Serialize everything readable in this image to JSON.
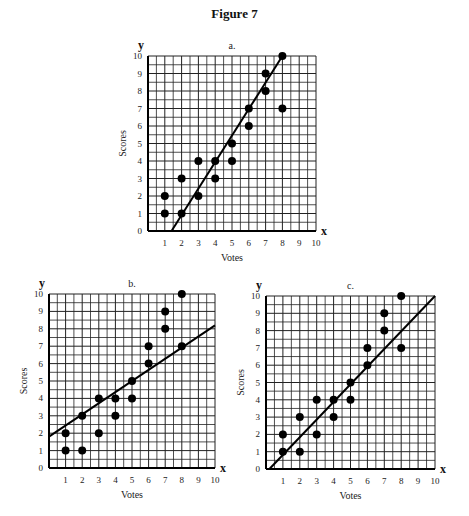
{
  "figure": {
    "title": "Figure 7"
  },
  "chart_data": [
    {
      "type": "scatter",
      "panel": "a.",
      "title": "a.",
      "xlabel": "Votes",
      "ylabel": "Scores",
      "x_axis_letter": "x",
      "y_axis_letter": "y",
      "xlim": [
        0,
        10
      ],
      "ylim": [
        0,
        10
      ],
      "xticks": [
        1,
        2,
        3,
        4,
        5,
        6,
        7,
        8,
        9,
        10
      ],
      "yticks": [
        0,
        1,
        2,
        3,
        4,
        5,
        6,
        7,
        8,
        9,
        10
      ],
      "grid": true,
      "points": [
        [
          1,
          1
        ],
        [
          1,
          2
        ],
        [
          2,
          1
        ],
        [
          2,
          3
        ],
        [
          3,
          2
        ],
        [
          3,
          4
        ],
        [
          4,
          3
        ],
        [
          4,
          4
        ],
        [
          5,
          4
        ],
        [
          5,
          5
        ],
        [
          6,
          6
        ],
        [
          6,
          7
        ],
        [
          7,
          8
        ],
        [
          7,
          9
        ],
        [
          8,
          7
        ],
        [
          8,
          10
        ]
      ],
      "fit_line": [
        [
          1.4,
          0
        ],
        [
          8,
          10
        ]
      ]
    },
    {
      "type": "scatter",
      "panel": "b.",
      "title": "b.",
      "xlabel": "Votes",
      "ylabel": "Scores",
      "x_axis_letter": "x",
      "y_axis_letter": "y",
      "xlim": [
        0,
        10
      ],
      "ylim": [
        0,
        10
      ],
      "xticks": [
        1,
        2,
        3,
        4,
        5,
        6,
        7,
        8,
        9,
        10
      ],
      "yticks": [
        0,
        1,
        2,
        3,
        4,
        5,
        6,
        7,
        8,
        9,
        10
      ],
      "grid": true,
      "points": [
        [
          1,
          1
        ],
        [
          1,
          2
        ],
        [
          2,
          1
        ],
        [
          2,
          3
        ],
        [
          3,
          2
        ],
        [
          3,
          4
        ],
        [
          4,
          3
        ],
        [
          4,
          4
        ],
        [
          5,
          4
        ],
        [
          5,
          5
        ],
        [
          6,
          6
        ],
        [
          6,
          7
        ],
        [
          7,
          8
        ],
        [
          7,
          9
        ],
        [
          8,
          7
        ],
        [
          8,
          10
        ]
      ],
      "fit_line": [
        [
          0,
          1.8
        ],
        [
          10,
          8.2
        ]
      ]
    },
    {
      "type": "scatter",
      "panel": "c.",
      "title": "c.",
      "xlabel": "Votes",
      "ylabel": "Scores",
      "x_axis_letter": "x",
      "y_axis_letter": "y",
      "xlim": [
        0,
        10
      ],
      "ylim": [
        0,
        10
      ],
      "xticks": [
        1,
        2,
        3,
        4,
        5,
        6,
        7,
        8,
        9,
        10
      ],
      "yticks": [
        0,
        1,
        2,
        3,
        4,
        5,
        6,
        7,
        8,
        9,
        10
      ],
      "grid": true,
      "points": [
        [
          1,
          1
        ],
        [
          1,
          2
        ],
        [
          2,
          1
        ],
        [
          2,
          3
        ],
        [
          3,
          2
        ],
        [
          3,
          4
        ],
        [
          4,
          3
        ],
        [
          4,
          4
        ],
        [
          5,
          4
        ],
        [
          5,
          5
        ],
        [
          6,
          6
        ],
        [
          6,
          7
        ],
        [
          7,
          8
        ],
        [
          7,
          9
        ],
        [
          8,
          7
        ],
        [
          8,
          10
        ]
      ],
      "fit_line": [
        [
          0.2,
          0
        ],
        [
          10,
          10
        ]
      ]
    }
  ],
  "layout": {
    "panels": [
      {
        "x0": 148,
        "x1": 316,
        "y0": 231,
        "y1": 56
      },
      {
        "x0": 49,
        "x1": 215,
        "y0": 468,
        "y1": 294
      },
      {
        "x0": 266,
        "x1": 435,
        "y0": 469,
        "y1": 296
      }
    ]
  }
}
